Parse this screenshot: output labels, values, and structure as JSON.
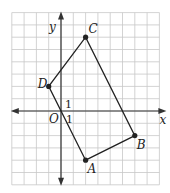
{
  "diagram": {
    "type": "coordinate-plane",
    "x_range": [
      -4,
      8
    ],
    "y_range": [
      -6,
      8
    ],
    "axis_labels": {
      "x": "x",
      "y": "y"
    },
    "origin_label": "O",
    "unit_labels": {
      "x": "1",
      "y": "1"
    },
    "points": [
      {
        "name": "A",
        "x": 2,
        "y": -4
      },
      {
        "name": "B",
        "x": 6,
        "y": -2
      },
      {
        "name": "C",
        "x": 2,
        "y": 6
      },
      {
        "name": "D",
        "x": -1,
        "y": 2
      }
    ],
    "polygon": [
      "A",
      "B",
      "C",
      "D"
    ],
    "colors": {
      "grid": "#c8c8c8",
      "axis": "#333333",
      "shape": "#222222"
    }
  }
}
